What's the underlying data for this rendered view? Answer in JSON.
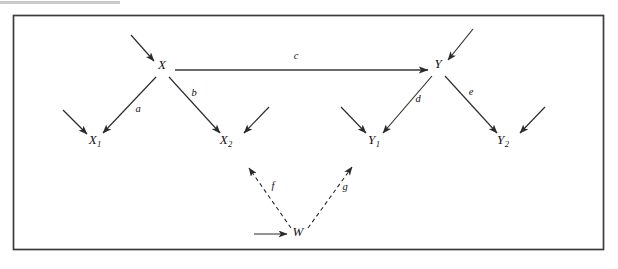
{
  "figure": {
    "type": "path-diagram",
    "title": "",
    "border": {
      "visible": true,
      "color": "#3c3c3c",
      "x": 13,
      "y": 15,
      "width": 591,
      "height": 235
    },
    "background_color": "#ffffff",
    "ink_color": "#2b2b2b"
  },
  "nodes": [
    {
      "id": "X",
      "label": "X",
      "subscript": "",
      "x": 162,
      "y": 69,
      "name": "node-x"
    },
    {
      "id": "Y",
      "label": "Y",
      "subscript": "",
      "x": 438,
      "y": 68,
      "name": "node-y"
    },
    {
      "id": "X1",
      "label": "X",
      "subscript": "1",
      "x": 95,
      "y": 144,
      "name": "node-x1"
    },
    {
      "id": "X2",
      "label": "X",
      "subscript": "2",
      "x": 226,
      "y": 144,
      "name": "node-x2"
    },
    {
      "id": "Y1",
      "label": "Y",
      "subscript": "1",
      "x": 374,
      "y": 144,
      "name": "node-y1"
    },
    {
      "id": "Y2",
      "label": "Y",
      "subscript": "2",
      "x": 503,
      "y": 144,
      "name": "node-y2"
    },
    {
      "id": "W",
      "label": "W",
      "subscript": "",
      "x": 298,
      "y": 236,
      "name": "node-w"
    }
  ],
  "edges": [
    {
      "id": "a",
      "label": "a",
      "from": "X",
      "to": "X1",
      "style": "solid",
      "x1": 156,
      "y1": 77,
      "x2": 103,
      "y2": 133,
      "label_x": 138,
      "label_y": 112,
      "name": "edge-a-x-to-x1"
    },
    {
      "id": "b",
      "label": "b",
      "from": "X",
      "to": "X2",
      "style": "solid",
      "x1": 169,
      "y1": 77,
      "x2": 220,
      "y2": 133,
      "label_x": 194,
      "label_y": 96,
      "name": "edge-b-x-to-x2"
    },
    {
      "id": "c",
      "label": "c",
      "from": "X",
      "to": "Y",
      "style": "solid",
      "x1": 175,
      "y1": 70,
      "x2": 428,
      "y2": 70,
      "label_x": 296,
      "label_y": 59,
      "name": "edge-c-x-to-y"
    },
    {
      "id": "d",
      "label": "d",
      "from": "Y",
      "to": "Y1",
      "style": "solid",
      "x1": 432,
      "y1": 76,
      "x2": 383,
      "y2": 133,
      "label_x": 418,
      "label_y": 102,
      "name": "edge-d-y-to-y1"
    },
    {
      "id": "e",
      "label": "e",
      "from": "Y",
      "to": "Y2",
      "style": "solid",
      "x1": 445,
      "y1": 76,
      "x2": 497,
      "y2": 133,
      "label_x": 471,
      "label_y": 95,
      "name": "edge-e-y-to-y2"
    },
    {
      "id": "f",
      "label": "f",
      "from": "W",
      "to": "X2",
      "style": "dashed",
      "x1": 291,
      "y1": 228,
      "x2": 249,
      "y2": 168,
      "label_x": 273,
      "label_y": 189,
      "name": "edge-f-w-to-x2"
    },
    {
      "id": "g",
      "label": "g",
      "from": "W",
      "to": "Y1",
      "style": "dashed",
      "x1": 308,
      "y1": 228,
      "x2": 352,
      "y2": 167,
      "label_x": 345,
      "label_y": 190,
      "name": "edge-g-w-to-y1"
    }
  ],
  "disturbance_arrows": [
    {
      "id": "e_X",
      "target": "X",
      "x1": 131,
      "y1": 35,
      "x2": 154,
      "y2": 61,
      "name": "disturbance-arrow-x"
    },
    {
      "id": "e_Y",
      "target": "Y",
      "x1": 473,
      "y1": 29,
      "x2": 448,
      "y2": 60,
      "name": "disturbance-arrow-y"
    },
    {
      "id": "e_X1",
      "target": "X1",
      "x1": 63,
      "y1": 110,
      "x2": 87,
      "y2": 134,
      "name": "disturbance-arrow-x1"
    },
    {
      "id": "e_X2",
      "target": "X2",
      "x1": 269,
      "y1": 107,
      "x2": 244,
      "y2": 133,
      "name": "disturbance-arrow-x2"
    },
    {
      "id": "e_Y1",
      "target": "Y1",
      "x1": 341,
      "y1": 107,
      "x2": 366,
      "y2": 133,
      "name": "disturbance-arrow-y1"
    },
    {
      "id": "e_Y2",
      "target": "Y2",
      "x1": 545,
      "y1": 107,
      "x2": 520,
      "y2": 133,
      "name": "disturbance-arrow-y2"
    },
    {
      "id": "e_W",
      "target": "W",
      "x1": 254,
      "y1": 234,
      "x2": 287,
      "y2": 234,
      "name": "disturbance-arrow-w"
    }
  ]
}
